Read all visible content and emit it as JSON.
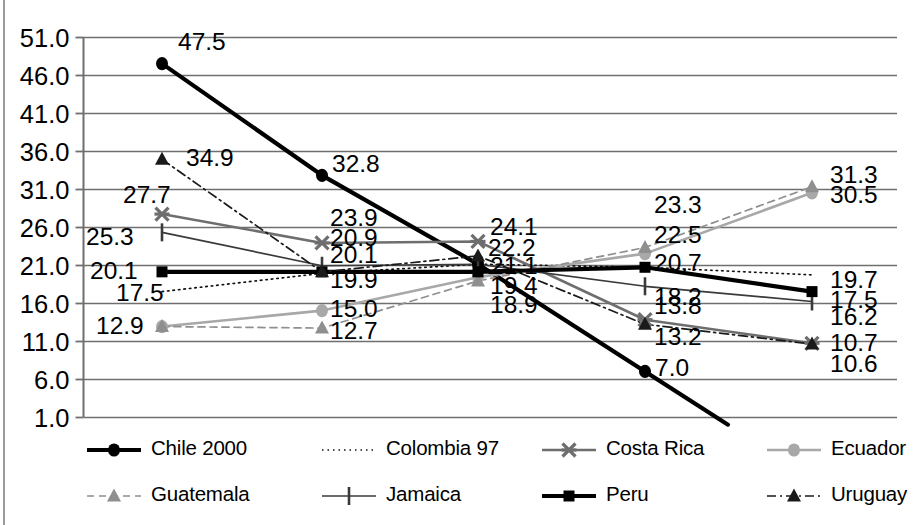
{
  "chart_data": {
    "type": "line",
    "title": "",
    "xlabel": "",
    "ylabel": "",
    "ylim": [
      1.0,
      51.0
    ],
    "ytick_step": 5.0,
    "yticks": [
      "51.0",
      "46.0",
      "41.0",
      "36.0",
      "31.0",
      "26.0",
      "21.0",
      "16.0",
      "11.0",
      "6.0",
      "1.0"
    ],
    "grid": true,
    "legend_position": "bottom",
    "x": [
      1,
      2,
      3,
      4,
      5
    ],
    "xtick_labels": [
      "",
      "",
      "",
      "",
      ""
    ],
    "series": [
      {
        "name": "Chile 2000",
        "color": "#000000",
        "marker": "circle",
        "line": "solid",
        "width": "thick",
        "values": [
          47.5,
          32.8,
          21.1,
          7.0,
          null
        ],
        "labels": [
          "47.5",
          "32.8",
          "21.1",
          "7.0",
          ""
        ]
      },
      {
        "name": "Colombia 97",
        "color": "#111111",
        "marker": "none",
        "line": "dotted",
        "width": "thin",
        "values": [
          17.5,
          19.9,
          21.1,
          20.7,
          19.7
        ],
        "labels": [
          "17.5",
          "19.9",
          "",
          "",
          "19.7"
        ]
      },
      {
        "name": "Costa Rica",
        "color": "#6e6e6e",
        "marker": "cross",
        "line": "solid",
        "width": "medium",
        "values": [
          27.7,
          23.9,
          24.1,
          13.8,
          10.7
        ],
        "labels": [
          "27.7",
          "23.9",
          "24.1",
          "13.8",
          "10.7"
        ]
      },
      {
        "name": "Ecuador",
        "color": "#a8a8a8",
        "marker": "circle",
        "line": "solid",
        "width": "medium",
        "values": [
          12.9,
          15.0,
          19.4,
          22.5,
          30.5
        ],
        "labels": [
          "12.9",
          "15.0",
          "19.4",
          "22.5",
          "30.5"
        ]
      },
      {
        "name": "Guatemala",
        "color": "#8f8f8f",
        "marker": "triangle",
        "line": "dashed",
        "width": "thin",
        "values": [
          12.9,
          12.7,
          18.9,
          23.3,
          31.3
        ],
        "labels": [
          "",
          "12.7",
          "18.9",
          "23.3",
          "31.3"
        ]
      },
      {
        "name": "Jamaica",
        "color": "#3a3a3a",
        "marker": "bar",
        "line": "solid",
        "width": "thin",
        "values": [
          25.3,
          20.9,
          21.1,
          18.2,
          16.2
        ],
        "labels": [
          "25.3",
          "20.9",
          "",
          "18.2",
          "16.2"
        ]
      },
      {
        "name": "Peru",
        "color": "#000000",
        "marker": "square",
        "line": "solid",
        "width": "thick",
        "values": [
          20.1,
          20.1,
          20.1,
          20.7,
          17.5
        ],
        "labels": [
          "20.1",
          "20.1",
          "",
          "20.7",
          "17.5"
        ]
      },
      {
        "name": "Uruguay",
        "color": "#1a1a1a",
        "marker": "triangle",
        "line": "dash-dot",
        "width": "thin",
        "values": [
          34.9,
          20.1,
          22.2,
          13.2,
          10.6
        ],
        "labels": [
          "34.9",
          "",
          "22.2",
          "13.2",
          "10.6"
        ]
      }
    ],
    "value_labels": [
      {
        "text": "47.5",
        "x": 178,
        "y": 50,
        "series": "Chile 2000"
      },
      {
        "text": "32.8",
        "x": 332,
        "y": 172,
        "series": "Chile 2000"
      },
      {
        "text": "7.0",
        "x": 655,
        "y": 376,
        "series": "Chile 2000"
      },
      {
        "text": "34.9",
        "x": 186,
        "y": 166,
        "series": "Uruguay"
      },
      {
        "text": "22.2",
        "x": 488,
        "y": 256,
        "series": "Uruguay"
      },
      {
        "text": "13.2",
        "x": 654,
        "y": 345,
        "series": "Uruguay"
      },
      {
        "text": "10.6",
        "x": 830,
        "y": 372,
        "series": "Uruguay"
      },
      {
        "text": "27.7",
        "x": 123,
        "y": 203,
        "series": "Costa Rica"
      },
      {
        "text": "23.9",
        "x": 330,
        "y": 226,
        "series": "Costa Rica"
      },
      {
        "text": "24.1",
        "x": 490,
        "y": 235,
        "series": "Costa Rica"
      },
      {
        "text": "13.8",
        "x": 654,
        "y": 314,
        "series": "Costa Rica"
      },
      {
        "text": "10.7",
        "x": 830,
        "y": 351,
        "series": "Costa Rica"
      },
      {
        "text": "25.3",
        "x": 86,
        "y": 245,
        "series": "Jamaica"
      },
      {
        "text": "20.9",
        "x": 330,
        "y": 246,
        "series": "Jamaica"
      },
      {
        "text": "21.1",
        "x": 490,
        "y": 274,
        "series": "Jamaica"
      },
      {
        "text": "18.2",
        "x": 654,
        "y": 305,
        "series": "Jamaica"
      },
      {
        "text": "16.2",
        "x": 830,
        "y": 325,
        "series": "Jamaica"
      },
      {
        "text": "20.1",
        "x": 90,
        "y": 279,
        "series": "Peru"
      },
      {
        "text": "20.1",
        "x": 330,
        "y": 263,
        "series": "Peru"
      },
      {
        "text": "20.7",
        "x": 654,
        "y": 271,
        "series": "Peru"
      },
      {
        "text": "17.5",
        "x": 830,
        "y": 308,
        "series": "Peru"
      },
      {
        "text": "17.5",
        "x": 116,
        "y": 301,
        "series": "Colombia 97"
      },
      {
        "text": "19.9",
        "x": 330,
        "y": 288,
        "series": "Colombia 97"
      },
      {
        "text": "19.7",
        "x": 830,
        "y": 288,
        "series": "Colombia 97"
      },
      {
        "text": "12.9",
        "x": 96,
        "y": 334,
        "series": "Ecuador"
      },
      {
        "text": "15.0",
        "x": 330,
        "y": 317,
        "series": "Ecuador"
      },
      {
        "text": "19.4",
        "x": 490,
        "y": 294,
        "series": "Ecuador"
      },
      {
        "text": "22.5",
        "x": 654,
        "y": 243,
        "series": "Ecuador"
      },
      {
        "text": "30.5",
        "x": 830,
        "y": 203,
        "series": "Ecuador"
      },
      {
        "text": "12.7",
        "x": 330,
        "y": 339,
        "series": "Guatemala"
      },
      {
        "text": "18.9",
        "x": 490,
        "y": 313,
        "series": "Guatemala"
      },
      {
        "text": "23.3",
        "x": 654,
        "y": 213,
        "series": "Guatemala"
      },
      {
        "text": "31.3",
        "x": 830,
        "y": 183,
        "series": "Guatemala"
      }
    ]
  },
  "legend": {
    "rows": [
      [
        {
          "label": "Chile 2000",
          "marker": "circle",
          "line": "solid",
          "color": "#000000",
          "width": "thick"
        },
        {
          "label": "Colombia 97",
          "marker": "none",
          "line": "dotted",
          "color": "#111111",
          "width": "thin"
        },
        {
          "label": "Costa Rica",
          "marker": "cross",
          "line": "solid",
          "color": "#6e6e6e",
          "width": "medium"
        },
        {
          "label": "Ecuador",
          "marker": "circle",
          "line": "solid",
          "color": "#a8a8a8",
          "width": "medium"
        }
      ],
      [
        {
          "label": "Guatemala",
          "marker": "triangle",
          "line": "dashed",
          "color": "#8f8f8f",
          "width": "thin"
        },
        {
          "label": "Jamaica",
          "marker": "bar",
          "line": "solid",
          "color": "#3a3a3a",
          "width": "thin"
        },
        {
          "label": "Peru",
          "marker": "square",
          "line": "solid",
          "color": "#000000",
          "width": "thick"
        },
        {
          "label": "Uruguay",
          "marker": "triangle",
          "line": "dash-dot",
          "color": "#1a1a1a",
          "width": "thin"
        }
      ]
    ]
  },
  "axis": {
    "grid_color": "#6f6f6f",
    "label_color": "#000000"
  }
}
